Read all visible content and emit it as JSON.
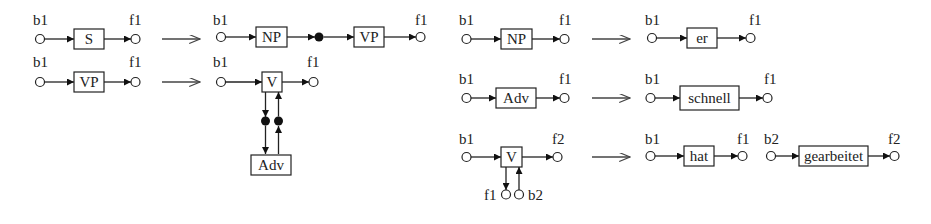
{
  "diagram": {
    "rules": [
      {
        "id": "rule-s",
        "lhs": {
          "start": "b1",
          "box": "S",
          "end": "f1"
        },
        "rhs": {
          "start": "b1",
          "boxes": [
            "NP",
            "VP"
          ],
          "intermediate": "filled-node",
          "end": "f1"
        }
      },
      {
        "id": "rule-vp",
        "lhs": {
          "start": "b1",
          "box": "VP",
          "end": "f1"
        },
        "rhs": {
          "start": "b1",
          "box": "V",
          "end": "f1",
          "attached_below": "Adv",
          "links": "bidirectional via filled nodes"
        }
      },
      {
        "id": "rule-np",
        "lhs": {
          "start": "b1",
          "box": "NP",
          "end": "f1"
        },
        "rhs": {
          "start": "b1",
          "box": "er",
          "end": "f1"
        }
      },
      {
        "id": "rule-adv",
        "lhs": {
          "start": "b1",
          "box": "Adv",
          "end": "f1"
        },
        "rhs": {
          "start": "b1",
          "box": "schnell",
          "end": "f1"
        }
      },
      {
        "id": "rule-v",
        "lhs": {
          "start": "b1",
          "box": "V",
          "end": "f2",
          "lower_nodes": [
            "f1",
            "b2"
          ]
        },
        "rhs": [
          {
            "start": "b1",
            "box": "hat",
            "end": "f1"
          },
          {
            "start": "b2",
            "box": "gearbeitet",
            "end": "f2"
          }
        ]
      }
    ],
    "labels": {
      "b1": "b1",
      "b2": "b2",
      "f1": "f1",
      "f2": "f2",
      "S": "S",
      "NP": "NP",
      "VP": "VP",
      "V": "V",
      "Adv": "Adv",
      "er": "er",
      "schnell": "schnell",
      "hat": "hat",
      "gearbeitet": "gearbeitet"
    },
    "colors": {
      "stroke": "#222222",
      "background": "#ffffff",
      "filled_node": "#111111"
    }
  }
}
